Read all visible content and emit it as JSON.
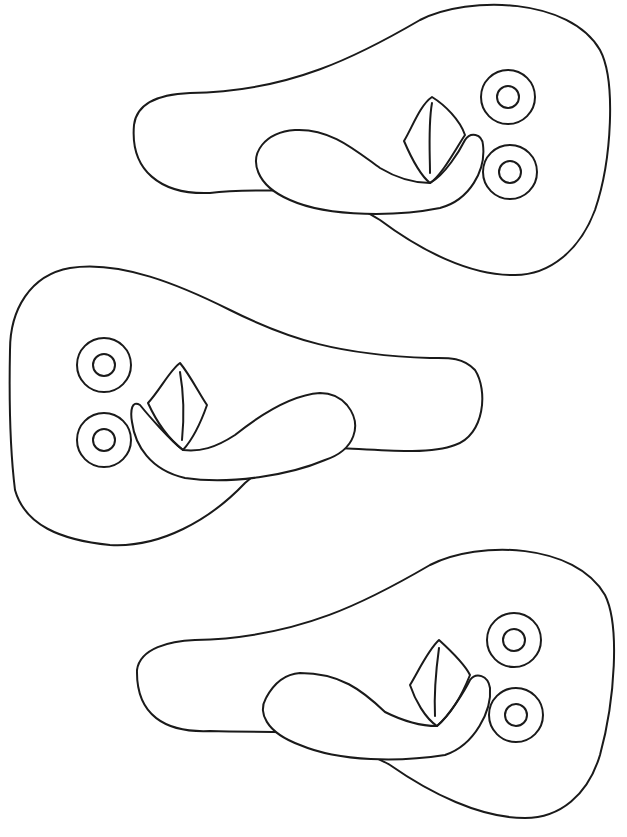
{
  "page": {
    "type": "coloring-page",
    "background": "#ffffff",
    "line_color": "#1a1a1a"
  },
  "sandals": [
    {
      "id": "sandal-top",
      "orientation": "toe-right",
      "bbox": [
        133,
        3,
        612,
        276
      ]
    },
    {
      "id": "sandal-middle",
      "orientation": "toe-left",
      "bbox": [
        8,
        267,
        484,
        546
      ]
    },
    {
      "id": "sandal-bottom",
      "orientation": "toe-right",
      "bbox": [
        135,
        545,
        614,
        819
      ]
    }
  ]
}
